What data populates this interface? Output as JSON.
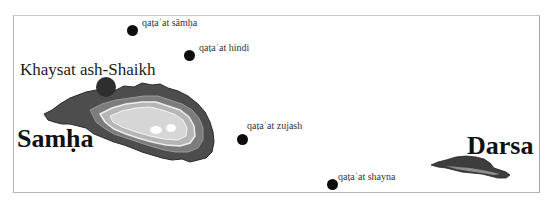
{
  "map": {
    "islands": [
      {
        "name": "Samḥa",
        "fill_outer": "#4a4a4a",
        "fill_mid": "#7a7a7a",
        "fill_inner": "#cfcfcf"
      },
      {
        "name": "Darsa",
        "fill_outer": "#3c3c3c",
        "fill_inner": "#8a8a8a"
      }
    ],
    "places": [
      {
        "name": "Khaysat ash-Shaikh"
      }
    ],
    "sites": [
      {
        "name": "qaṭaʿat sāmḥa",
        "x": 133,
        "y": 31
      },
      {
        "name": "qaṭaʿat hindi",
        "x": 190,
        "y": 56
      },
      {
        "name": "qaṭaʿat zujash",
        "x": 243,
        "y": 140
      },
      {
        "name": "qaṭaʿat shayna",
        "x": 333,
        "y": 185
      }
    ],
    "colors": {
      "frame": "#b4b4b4",
      "dot": "#0d0d0d",
      "text": "#1a1a1a"
    }
  }
}
